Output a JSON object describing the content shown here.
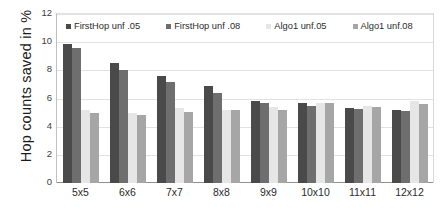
{
  "chart_data": {
    "type": "bar",
    "title": "",
    "xlabel": "",
    "ylabel": "Hop counts  saved in %",
    "ylim": [
      0,
      12
    ],
    "yticks": [
      0,
      2,
      4,
      6,
      8,
      10,
      12
    ],
    "grid": true,
    "legend_position": "top-inside",
    "categories": [
      "5x5",
      "6x6",
      "7x7",
      "8x8",
      "9x9",
      "10x10",
      "11x11",
      "12x12"
    ],
    "series": [
      {
        "name": "FirstHop unf .05",
        "color": "#4a4a4a",
        "values": [
          9.9,
          8.5,
          7.6,
          6.9,
          5.8,
          5.65,
          5.35,
          5.2
        ]
      },
      {
        "name": "FirstHop unf .08",
        "color": "#6e6e6e",
        "values": [
          9.6,
          8.0,
          7.2,
          6.4,
          5.65,
          5.45,
          5.25,
          5.1
        ]
      },
      {
        "name": "Algo1 unf.05",
        "color": "#e6e6e6",
        "values": [
          5.15,
          4.95,
          5.3,
          5.2,
          5.4,
          5.7,
          5.5,
          5.85
        ]
      },
      {
        "name": "Algo1 unf.08",
        "color": "#a6a6a6",
        "values": [
          5.0,
          4.8,
          5.05,
          5.15,
          5.2,
          5.65,
          5.4,
          5.6
        ]
      }
    ]
  },
  "axis": {
    "y_title": "Hop counts  saved in %",
    "y_tick_labels": [
      "12",
      "10",
      "8",
      "6",
      "4",
      "2",
      "0"
    ]
  },
  "legend": {
    "items": [
      {
        "label": "FirstHop unf .05",
        "color": "#4a4a4a"
      },
      {
        "label": "FirstHop unf .08",
        "color": "#6e6e6e"
      },
      {
        "label": "Algo1 unf.05",
        "color": "#e6e6e6"
      },
      {
        "label": "Algo1 unf.08",
        "color": "#a6a6a6"
      }
    ]
  }
}
